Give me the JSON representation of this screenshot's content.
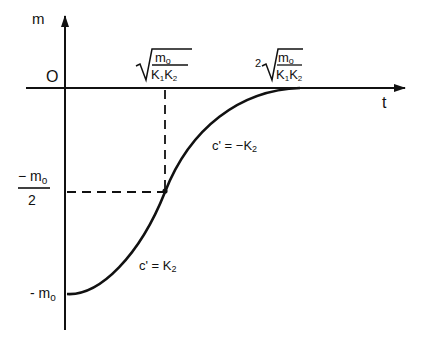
{
  "axes": {
    "y_label": "m",
    "x_label": "t",
    "origin_label": "O"
  },
  "y_ticks": {
    "half": {
      "numerator": "− m",
      "numerator_sub": "o",
      "denominator": "2"
    },
    "min": {
      "text": "- m",
      "sub": "o"
    }
  },
  "x_ticks": {
    "first": {
      "coef": "",
      "num": "m",
      "num_sub": "o",
      "den": "K",
      "den_sub1": "1",
      "den2": "K",
      "den_sub2": "2"
    },
    "second": {
      "coef": "2",
      "num": "m",
      "num_sub": "o",
      "den": "K",
      "den_sub1": "1",
      "den2": "K",
      "den_sub2": "2"
    }
  },
  "annotations": {
    "lower": {
      "text": "c' = K",
      "sub": "2"
    },
    "upper": {
      "text": "c' = −K",
      "sub": "2"
    }
  },
  "colors": {
    "ink": "#111111",
    "background": "#ffffff"
  }
}
